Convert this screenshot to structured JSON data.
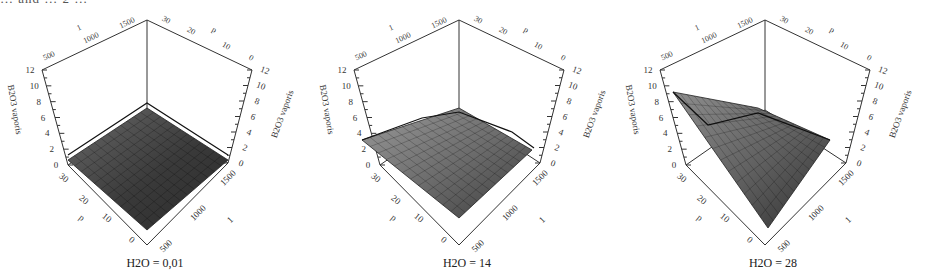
{
  "header": {
    "cut_text": "… and … 2 …"
  },
  "chart_data": [
    {
      "type": "surface3d",
      "title": "H2O = 0,01",
      "axes": {
        "z": {
          "label": "B2O3 vaporis",
          "ticks": [
            0,
            2,
            4,
            6,
            8,
            10,
            12
          ],
          "range": [
            0,
            12
          ]
        },
        "x": {
          "label": "T",
          "ticks": [
            500,
            1000,
            1500
          ]
        },
        "y": {
          "label": "p",
          "ticks": [
            0,
            10,
            20,
            30
          ]
        }
      },
      "surface_description": "nearly flat low surface (~0-1), slight ridge along back edge, dark shading"
    },
    {
      "type": "surface3d",
      "title": "H2O = 14",
      "axes": {
        "z": {
          "label": "B2O3 vaporis",
          "ticks": [
            0,
            2,
            4,
            6,
            8,
            10,
            12
          ],
          "range": [
            0,
            12
          ]
        },
        "x": {
          "label": "T",
          "ticks": [
            500,
            1000,
            1500
          ]
        },
        "y": {
          "label": "p",
          "ticks": [
            0,
            10,
            20,
            30
          ]
        }
      },
      "surface_description": "saddle-shaped surface, edges rise to ~4-5, central dark minimum"
    },
    {
      "type": "surface3d",
      "title": "H2O = 28",
      "axes": {
        "z": {
          "label": "B2O3 vaporis",
          "ticks": [
            0,
            2,
            4,
            6,
            8,
            10,
            12
          ],
          "range": [
            0,
            12
          ]
        },
        "x": {
          "label": "T",
          "ticks": [
            500,
            1000,
            1500
          ]
        },
        "y": {
          "label": "p",
          "ticks": [
            0,
            10,
            20,
            30
          ]
        }
      },
      "surface_description": "deep bowl surface, left corner rises to ~10, dark minimum near front-right"
    }
  ],
  "panels": [
    {
      "caption": "H2O = 0,01"
    },
    {
      "caption": "H2O = 14"
    },
    {
      "caption": "H2O = 28"
    }
  ],
  "labels": {
    "z_left": "B2O3 vaporis",
    "z_right": "B2O3 vaporis",
    "p": "p",
    "t": "1",
    "z_ticks": [
      "0",
      "2",
      "4",
      "6",
      "8",
      "10",
      "12"
    ],
    "t_ticks": [
      "500",
      "1000",
      "1500"
    ],
    "p_ticks": [
      "0",
      "10",
      "20",
      "30"
    ]
  }
}
